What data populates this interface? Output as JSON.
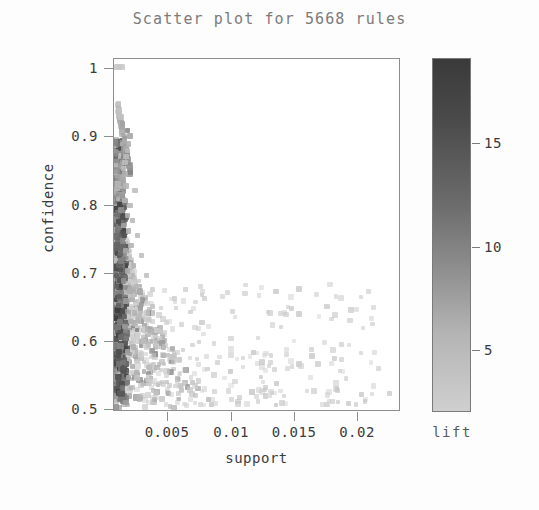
{
  "chart_data": {
    "type": "scatter",
    "title": "Scatter plot for 5668 rules",
    "xlabel": "support",
    "ylabel": "confidence",
    "xlim": [
      0.0009,
      0.0233
    ],
    "ylim": [
      0.487,
      1.012
    ],
    "grid": false,
    "n_rules": 5668,
    "xticks": [
      0.005,
      0.01,
      0.015,
      0.02
    ],
    "xtick_labels": [
      "0.005",
      "0.01",
      "0.015",
      "0.02"
    ],
    "yticks": [
      0.5,
      0.6,
      0.7,
      0.8,
      0.9,
      1
    ],
    "ytick_labels": [
      "0.5",
      "0.6",
      "0.7",
      "0.8",
      "0.9",
      "1"
    ],
    "colorbar": {
      "label": "lift",
      "position": "right",
      "ticks": [
        5,
        10,
        15
      ],
      "tick_labels": [
        "5",
        "10",
        "15"
      ],
      "vmin": 1.2,
      "vmax": 18.5,
      "colormap": "grayscale",
      "high_color": "#3a3a3a",
      "low_color": "#cfcfcf"
    },
    "marker": "square",
    "point_color_semantics": "grayscale by lift; darker = higher lift",
    "points": [
      {
        "support": 0.00115,
        "confidence": 1.0,
        "lift": 2.6
      },
      {
        "support": 0.00135,
        "confidence": 1.0,
        "lift": 2.4
      },
      {
        "support": 0.00155,
        "confidence": 1.0,
        "lift": 2.3
      },
      {
        "support": 0.00125,
        "confidence": 0.945,
        "lift": 3.0
      },
      {
        "support": 0.00135,
        "confidence": 0.935,
        "lift": 3.1
      },
      {
        "support": 0.00145,
        "confidence": 0.925,
        "lift": 3.2
      },
      {
        "support": 0.00155,
        "confidence": 0.915,
        "lift": 6.8
      },
      {
        "support": 0.00195,
        "confidence": 0.905,
        "lift": 9.3
      },
      {
        "support": 0.00215,
        "confidence": 0.897,
        "lift": 6.4
      },
      {
        "support": 0.00205,
        "confidence": 0.885,
        "lift": 4.9
      },
      {
        "support": 0.00195,
        "confidence": 0.875,
        "lift": 4.4
      },
      {
        "support": 0.00185,
        "confidence": 0.866,
        "lift": 4.2
      },
      {
        "support": 0.00175,
        "confidence": 0.857,
        "lift": 4.0
      },
      {
        "support": 0.00165,
        "confidence": 0.848,
        "lift": 3.8
      },
      {
        "support": 0.00175,
        "confidence": 0.84,
        "lift": 5.4
      },
      {
        "support": 0.00165,
        "confidence": 0.831,
        "lift": 6.2
      },
      {
        "support": 0.00185,
        "confidence": 0.822,
        "lift": 4.6
      },
      {
        "support": 0.00255,
        "confidence": 0.815,
        "lift": 3.6
      },
      {
        "support": 0.00155,
        "confidence": 0.806,
        "lift": 7.6
      },
      {
        "support": 0.00175,
        "confidence": 0.8,
        "lift": 5.0
      },
      {
        "support": 0.00215,
        "confidence": 0.793,
        "lift": 4.3
      },
      {
        "support": 0.00145,
        "confidence": 0.786,
        "lift": 8.8
      },
      {
        "support": 0.00195,
        "confidence": 0.778,
        "lift": 5.7
      },
      {
        "support": 0.00235,
        "confidence": 0.77,
        "lift": 4.1
      },
      {
        "support": 0.00165,
        "confidence": 0.763,
        "lift": 6.9
      },
      {
        "support": 0.00205,
        "confidence": 0.755,
        "lift": 5.2
      },
      {
        "support": 0.00275,
        "confidence": 0.748,
        "lift": 3.9
      },
      {
        "support": 0.00155,
        "confidence": 0.74,
        "lift": 9.7
      },
      {
        "support": 0.00225,
        "confidence": 0.733,
        "lift": 4.8
      },
      {
        "support": 0.00185,
        "confidence": 0.726,
        "lift": 6.1
      },
      {
        "support": 0.00305,
        "confidence": 0.718,
        "lift": 3.5
      },
      {
        "support": 0.00145,
        "confidence": 0.71,
        "lift": 10.5
      },
      {
        "support": 0.00245,
        "confidence": 0.703,
        "lift": 4.7
      },
      {
        "support": 0.00195,
        "confidence": 0.695,
        "lift": 6.0
      },
      {
        "support": 0.00345,
        "confidence": 0.688,
        "lift": 3.3
      },
      {
        "support": 0.00165,
        "confidence": 0.68,
        "lift": 9.1
      },
      {
        "support": 0.00265,
        "confidence": 0.672,
        "lift": 4.5
      },
      {
        "support": 0.00215,
        "confidence": 0.665,
        "lift": 5.6
      },
      {
        "support": 0.00135,
        "confidence": 0.657,
        "lift": 14.5
      },
      {
        "support": 0.00185,
        "confidence": 0.65,
        "lift": 7.4
      },
      {
        "support": 0.00395,
        "confidence": 0.642,
        "lift": 3.1
      },
      {
        "support": 0.00155,
        "confidence": 0.634,
        "lift": 16.2
      },
      {
        "support": 0.00285,
        "confidence": 0.627,
        "lift": 4.4
      },
      {
        "support": 0.00225,
        "confidence": 0.619,
        "lift": 5.3
      },
      {
        "support": 0.00175,
        "confidence": 0.612,
        "lift": 8.2
      },
      {
        "support": 0.00455,
        "confidence": 0.604,
        "lift": 2.9
      },
      {
        "support": 0.00145,
        "confidence": 0.596,
        "lift": 13.0
      },
      {
        "support": 0.00325,
        "confidence": 0.589,
        "lift": 4.0
      },
      {
        "support": 0.00245,
        "confidence": 0.581,
        "lift": 5.1
      },
      {
        "support": 0.00195,
        "confidence": 0.574,
        "lift": 7.0
      },
      {
        "support": 0.00545,
        "confidence": 0.566,
        "lift": 2.7
      },
      {
        "support": 0.00165,
        "confidence": 0.558,
        "lift": 11.8
      },
      {
        "support": 0.00365,
        "confidence": 0.551,
        "lift": 3.8
      },
      {
        "support": 0.00265,
        "confidence": 0.543,
        "lift": 4.9
      },
      {
        "support": 0.00205,
        "confidence": 0.536,
        "lift": 6.6
      },
      {
        "support": 0.00705,
        "confidence": 0.528,
        "lift": 2.5
      },
      {
        "support": 0.00155,
        "confidence": 0.52,
        "lift": 12.4
      },
      {
        "support": 0.00425,
        "confidence": 0.513,
        "lift": 3.4
      },
      {
        "support": 0.00295,
        "confidence": 0.505,
        "lift": 4.6
      },
      {
        "support": 0.00185,
        "confidence": 0.498,
        "lift": 7.8
      },
      {
        "support": 0.01005,
        "confidence": 0.545,
        "lift": 2.2
      },
      {
        "support": 0.01185,
        "confidence": 0.573,
        "lift": 2.1
      },
      {
        "support": 0.01365,
        "confidence": 0.527,
        "lift": 2.0
      },
      {
        "support": 0.01545,
        "confidence": 0.556,
        "lift": 1.9
      },
      {
        "support": 0.02255,
        "confidence": 0.512,
        "lift": 1.7
      }
    ]
  }
}
